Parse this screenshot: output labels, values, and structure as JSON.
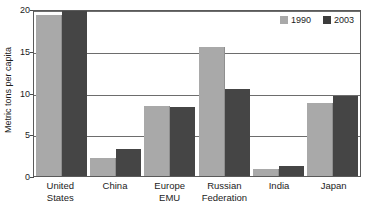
{
  "chart_data": {
    "type": "bar",
    "title": "",
    "xlabel": "",
    "ylabel": "Metric tons per capita",
    "ylim": [
      0,
      20
    ],
    "yticks": [
      0,
      5,
      10,
      15,
      20
    ],
    "ytick_labels": [
      "0",
      "5",
      "10",
      "15",
      "20"
    ],
    "grid": true,
    "legend_position": "top-right",
    "categories": [
      "United States",
      "China",
      "Europe EMU",
      "Russian Federation",
      "India",
      "Japan"
    ],
    "category_lines": [
      [
        "United",
        "States"
      ],
      [
        "China"
      ],
      [
        "Europe",
        "EMU"
      ],
      [
        "Russian",
        "Federation"
      ],
      [
        "India"
      ],
      [
        "Japan"
      ]
    ],
    "series": [
      {
        "name": "1990",
        "color": "#a9a9a9",
        "values": [
          19.3,
          2.1,
          8.4,
          15.4,
          0.8,
          8.7
        ]
      },
      {
        "name": "2003",
        "color": "#454545",
        "values": [
          20.0,
          3.2,
          8.3,
          10.4,
          1.2,
          9.6
        ]
      }
    ]
  },
  "legend": {
    "entries": [
      {
        "label": "1990"
      },
      {
        "label": "2003"
      }
    ]
  }
}
